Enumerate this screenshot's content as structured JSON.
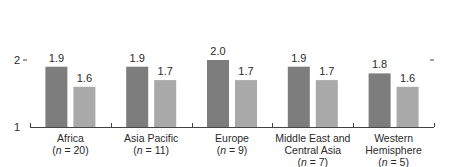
{
  "chart_data": {
    "type": "bar",
    "title": "",
    "xlabel": "",
    "ylabel": "",
    "ylim": [
      1,
      2
    ],
    "yticks": [
      1,
      2
    ],
    "grid": false,
    "legend": null,
    "categories": [
      {
        "name": "Africa",
        "n": "(n = 20)"
      },
      {
        "name": "Asia Pacific",
        "n": "(n = 11)"
      },
      {
        "name": "Europe",
        "n": "(n = 9)"
      },
      {
        "name": "Middle East and Central Asia",
        "n": "(n = 7)"
      },
      {
        "name": "Western Hemisphere",
        "n": "(n = 5)"
      }
    ],
    "series": [
      {
        "name": "Series 1",
        "color": "#7d7d7d",
        "values": [
          1.9,
          1.9,
          2.0,
          1.9,
          1.8
        ]
      },
      {
        "name": "Series 2",
        "color": "#a9a9a9",
        "values": [
          1.6,
          1.7,
          1.7,
          1.7,
          1.6
        ]
      }
    ],
    "category_lines": [
      [
        "Africa"
      ],
      [
        "Asia Pacific"
      ],
      [
        "Europe"
      ],
      [
        "Middle East and",
        "Central Asia"
      ],
      [
        "Western",
        "Hemisphere"
      ]
    ],
    "n_labels": [
      "20",
      "11",
      "9",
      "7",
      "5"
    ]
  }
}
